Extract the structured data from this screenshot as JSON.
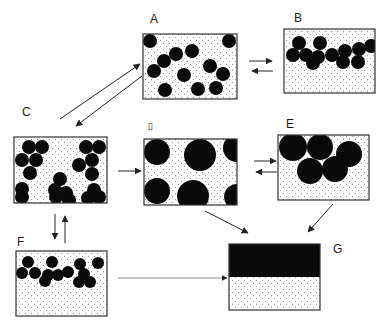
{
  "diagram": {
    "title": "",
    "colors": {
      "particle": "#0a0a0a",
      "frame": "#333333",
      "dot": "#888888",
      "background": "#ffffff"
    },
    "states": [
      {
        "id": "A",
        "label": "A",
        "description": "Dispersed small particles throughout volume",
        "box": [
          143,
          34,
          94,
          65
        ],
        "particles": [
          [
            150,
            41,
            7
          ],
          [
            229,
            41,
            7
          ],
          [
            192,
            51,
            7
          ],
          [
            164,
            61,
            7
          ],
          [
            176,
            54,
            7
          ],
          [
            154,
            71,
            7
          ],
          [
            210,
            66,
            7
          ],
          [
            223,
            74,
            7
          ],
          [
            184,
            75,
            7
          ],
          [
            165,
            90,
            7
          ],
          [
            198,
            89,
            7
          ],
          [
            216,
            88,
            7
          ]
        ]
      },
      {
        "id": "B",
        "label": "B",
        "description": "Small particles creamed/aggregated at top",
        "box": [
          284,
          29,
          91,
          64
        ],
        "particles": [
          [
            293,
            55,
            7
          ],
          [
            299,
            43,
            7
          ],
          [
            306,
            55,
            7
          ],
          [
            320,
            43,
            7
          ],
          [
            318,
            57,
            7
          ],
          [
            313,
            63,
            7
          ],
          [
            332,
            55,
            7
          ],
          [
            345,
            51,
            7
          ],
          [
            343,
            62,
            7
          ],
          [
            359,
            49,
            7
          ],
          [
            358,
            62,
            7
          ],
          [
            371,
            46,
            7
          ]
        ]
      },
      {
        "id": "C",
        "label": "C",
        "description": "Flocculated clusters of small particles",
        "box": [
          14,
          137,
          93,
          66
        ],
        "particles": [
          [
            29,
            147,
            7
          ],
          [
            42,
            147,
            7
          ],
          [
            22,
            160,
            7
          ],
          [
            36,
            160,
            7
          ],
          [
            30,
            173,
            7
          ],
          [
            86,
            147,
            7
          ],
          [
            99,
            147,
            7
          ],
          [
            92,
            160,
            7
          ],
          [
            79,
            165,
            7
          ],
          [
            92,
            174,
            7
          ],
          [
            22,
            189,
            7
          ],
          [
            22,
            197,
            7
          ],
          [
            60,
            179,
            7
          ],
          [
            55,
            190,
            7
          ],
          [
            66,
            193,
            7
          ],
          [
            56,
            197,
            7
          ],
          [
            69,
            200,
            7
          ],
          [
            94,
            190,
            7
          ],
          [
            99,
            197,
            7
          ],
          [
            88,
            198,
            7
          ]
        ]
      },
      {
        "id": "D",
        "label": "▯",
        "description": "Coalesced large droplets dispersed",
        "box": [
          144,
          139,
          93,
          66
        ],
        "particles": [
          [
            157,
            152,
            13
          ],
          [
            200,
            155,
            16
          ],
          [
            237,
            148,
            14
          ],
          [
            157,
            191,
            13
          ],
          [
            193,
            196,
            16
          ],
          [
            237,
            197,
            13
          ]
        ]
      },
      {
        "id": "E",
        "label": "E",
        "description": "Large droplets creamed at top",
        "box": [
          278,
          135,
          91,
          65
        ],
        "particles": [
          [
            293,
            147,
            14
          ],
          [
            320,
            147,
            13
          ],
          [
            349,
            154,
            13
          ],
          [
            310,
            171,
            13
          ],
          [
            335,
            169,
            13
          ]
        ]
      },
      {
        "id": "F",
        "label": "F",
        "description": "Creamed flocculated small particles at top",
        "box": [
          16,
          251,
          91,
          65
        ],
        "particles": [
          [
            28,
            262,
            6
          ],
          [
            22,
            273,
            6
          ],
          [
            35,
            273,
            6
          ],
          [
            52,
            262,
            6
          ],
          [
            48,
            275,
            6
          ],
          [
            58,
            275,
            6
          ],
          [
            45,
            281,
            6
          ],
          [
            68,
            272,
            6
          ],
          [
            80,
            264,
            6
          ],
          [
            84,
            274,
            6
          ],
          [
            79,
            282,
            6
          ],
          [
            90,
            282,
            6
          ],
          [
            98,
            263,
            6
          ]
        ]
      },
      {
        "id": "G",
        "label": "G",
        "description": "Complete phase separation",
        "box": [
          229,
          244,
          91,
          66
        ],
        "dark_fraction": 0.5
      }
    ],
    "transitions": [
      {
        "from": "C",
        "to": "A",
        "type": "reversible"
      },
      {
        "from": "A",
        "to": "B",
        "type": "reversible"
      },
      {
        "from": "C",
        "to": "D",
        "type": "forward"
      },
      {
        "from": "D",
        "to": "E",
        "type": "reversible"
      },
      {
        "from": "D",
        "to": "G",
        "type": "forward"
      },
      {
        "from": "E",
        "to": "G",
        "type": "forward"
      },
      {
        "from": "C",
        "to": "F",
        "type": "reversible"
      },
      {
        "from": "F",
        "to": "G",
        "type": "forward-dotted"
      }
    ]
  }
}
